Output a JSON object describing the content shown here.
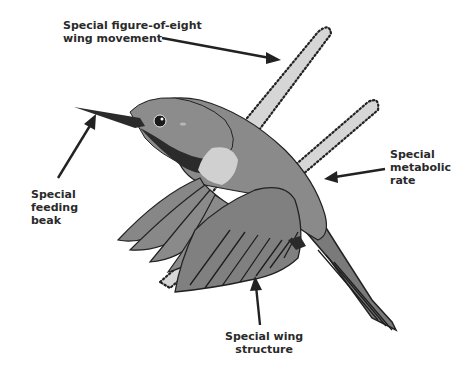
{
  "diagram": {
    "labels": {
      "wing_movement": [
        "Special figure-of-eight",
        "wing movement"
      ],
      "feeding_beak": [
        "Special",
        "feeding",
        "beak"
      ],
      "metabolic_rate": [
        "Special",
        "metabolic",
        "rate"
      ],
      "wing_structure": [
        "Special wing",
        "structure"
      ]
    },
    "colors": {
      "body": "#808080",
      "dark": "#2b2b2b",
      "throat_patch": "#d0d0d0",
      "wing_path_fill": "#d6d6d6",
      "text": "#2a2a2a"
    }
  }
}
